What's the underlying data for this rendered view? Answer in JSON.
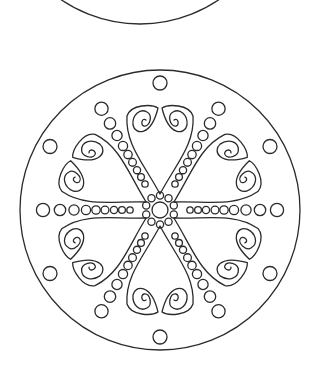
{
  "image": {
    "width": 313,
    "height": 368,
    "background": "#ffffff",
    "line_color": "#2b2b2b",
    "description": "Coloring page mandala line art"
  },
  "top_partial_circle": {
    "cx": 140,
    "cy": -116,
    "r": 140
  },
  "mandala": {
    "cx": 160,
    "cy": 210,
    "outer_r": 140,
    "center_circle_r": 8,
    "center_ring": {
      "count": 10,
      "ring_r": 14.5,
      "dot_r": 3.6
    },
    "hearts": {
      "angles_deg": [
        90,
        30,
        150,
        210,
        270,
        330
      ],
      "point_dist": 16,
      "top_dist": 106,
      "half_width": 33,
      "spiral_offset": 15,
      "spiral_dist": 89,
      "outer_dot": {
        "dist": 127,
        "r": 7
      }
    },
    "rays": {
      "angles_deg": [
        0,
        60,
        120,
        180,
        240,
        300
      ],
      "dots": [
        {
          "dist": 30,
          "r": 3.2
        },
        {
          "dist": 38,
          "r": 3.4
        },
        {
          "dist": 46,
          "r": 3.6
        },
        {
          "dist": 55,
          "r": 3.9
        },
        {
          "dist": 64,
          "r": 4.2
        },
        {
          "dist": 74,
          "r": 4.6
        },
        {
          "dist": 86,
          "r": 5.1
        },
        {
          "dist": 100,
          "r": 5.7
        },
        {
          "dist": 117,
          "r": 6.6
        }
      ]
    }
  }
}
